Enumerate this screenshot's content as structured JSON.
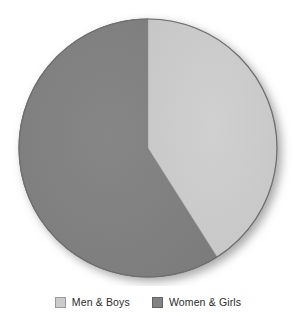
{
  "chart_data": {
    "type": "pie",
    "title": "",
    "subtitle": "",
    "xlabel": "",
    "ylabel": "",
    "grid": false,
    "legend_position": "bottom",
    "start_angle_deg": 0,
    "direction": "clockwise",
    "categories": [
      "Men & Boys",
      "Women & Girls"
    ],
    "values": [
      41,
      59
    ],
    "unit": "%",
    "slices": [
      {
        "label": "Men & Boys",
        "value": 41,
        "percent": 41,
        "sweep_deg": 147.6,
        "color": "#cbcbcb"
      },
      {
        "label": "Women & Girls",
        "value": 59,
        "percent": 59,
        "sweep_deg": 212.4,
        "color": "#828282"
      }
    ]
  },
  "pie": {
    "center_x": 148,
    "center_y": 148,
    "radius": 129,
    "shadow_color": "#9a9a9a",
    "edge_color": "#6e6e6e",
    "background": "#ffffff"
  },
  "legend": {
    "items": [
      {
        "label": "Men & Boys",
        "color": "#cbcbcb",
        "swatch": "legend-swatch-light"
      },
      {
        "label": "Women & Girls",
        "color": "#828282",
        "swatch": "legend-swatch-dark"
      }
    ]
  }
}
